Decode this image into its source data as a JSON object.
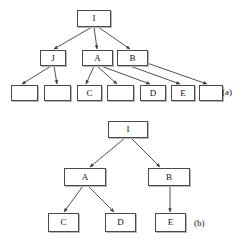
{
  "figure": {
    "panels": [
      {
        "id": "a",
        "label": "(a)",
        "label_x": 222,
        "label_y": 88,
        "nodes": [
          {
            "name": "root-i",
            "text": "I",
            "x": 77,
            "y": 10,
            "w": 34,
            "h": 17
          },
          {
            "name": "node-j",
            "text": "J",
            "x": 40,
            "y": 50,
            "w": 26,
            "h": 16
          },
          {
            "name": "node-a",
            "text": "A",
            "x": 82,
            "y": 50,
            "w": 31,
            "h": 16
          },
          {
            "name": "node-b",
            "text": "B",
            "x": 117,
            "y": 50,
            "w": 31,
            "h": 16
          },
          {
            "name": "leaf-blank-1",
            "text": "",
            "x": 11,
            "y": 85,
            "w": 27,
            "h": 16
          },
          {
            "name": "leaf-blank-2",
            "text": "",
            "x": 44,
            "y": 85,
            "w": 27,
            "h": 16
          },
          {
            "name": "leaf-c",
            "text": "C",
            "x": 77,
            "y": 85,
            "w": 25,
            "h": 16
          },
          {
            "name": "leaf-blank-3",
            "text": "",
            "x": 107,
            "y": 85,
            "w": 27,
            "h": 16
          },
          {
            "name": "leaf-d",
            "text": "D",
            "x": 140,
            "y": 85,
            "w": 26,
            "h": 16
          },
          {
            "name": "leaf-e",
            "text": "E",
            "x": 171,
            "y": 85,
            "w": 24,
            "h": 16
          },
          {
            "name": "leaf-blank-4",
            "text": "",
            "x": 199,
            "y": 85,
            "w": 24,
            "h": 16
          }
        ],
        "edges": [
          {
            "name": "edge-i-j",
            "x1": 92,
            "y1": 27,
            "x2": 54,
            "y2": 49
          },
          {
            "name": "edge-i-a",
            "x1": 94,
            "y1": 27,
            "x2": 97,
            "y2": 49
          },
          {
            "name": "edge-i-b",
            "x1": 98,
            "y1": 27,
            "x2": 130,
            "y2": 49
          },
          {
            "name": "edge-j-l1",
            "x1": 51,
            "y1": 66,
            "x2": 22,
            "y2": 84
          },
          {
            "name": "edge-j-l2",
            "x1": 54,
            "y1": 66,
            "x2": 57,
            "y2": 84
          },
          {
            "name": "edge-a-c",
            "x1": 94,
            "y1": 66,
            "x2": 86,
            "y2": 84
          },
          {
            "name": "edge-a-l3",
            "x1": 97,
            "y1": 66,
            "x2": 117,
            "y2": 84
          },
          {
            "name": "edge-a-d",
            "x1": 101,
            "y1": 66,
            "x2": 150,
            "y2": 84
          },
          {
            "name": "edge-b-e",
            "x1": 130,
            "y1": 66,
            "x2": 180,
            "y2": 84
          },
          {
            "name": "edge-b-l4",
            "x1": 147,
            "y1": 63,
            "x2": 207,
            "y2": 84
          }
        ]
      },
      {
        "id": "b",
        "label": "(b)",
        "label_x": 194,
        "label_y": 219,
        "nodes": [
          {
            "name": "root-i",
            "text": "I",
            "x": 108,
            "y": 121,
            "w": 40,
            "h": 17
          },
          {
            "name": "node-a",
            "text": "A",
            "x": 64,
            "y": 168,
            "w": 42,
            "h": 18
          },
          {
            "name": "node-b",
            "text": "B",
            "x": 148,
            "y": 168,
            "w": 42,
            "h": 18
          },
          {
            "name": "leaf-c",
            "text": "C",
            "x": 48,
            "y": 213,
            "w": 31,
            "h": 19
          },
          {
            "name": "leaf-d",
            "text": "D",
            "x": 105,
            "y": 213,
            "w": 31,
            "h": 19
          },
          {
            "name": "leaf-e",
            "text": "E",
            "x": 155,
            "y": 213,
            "w": 31,
            "h": 19
          }
        ],
        "edges": [
          {
            "name": "edge-i-a",
            "x1": 125,
            "y1": 138,
            "x2": 90,
            "y2": 167
          },
          {
            "name": "edge-i-b",
            "x1": 131,
            "y1": 138,
            "x2": 160,
            "y2": 167
          },
          {
            "name": "edge-a-c",
            "x1": 83,
            "y1": 186,
            "x2": 64,
            "y2": 212
          },
          {
            "name": "edge-a-d",
            "x1": 88,
            "y1": 186,
            "x2": 114,
            "y2": 212
          },
          {
            "name": "edge-b-e",
            "x1": 170,
            "y1": 186,
            "x2": 170,
            "y2": 212
          }
        ]
      }
    ]
  },
  "style": {
    "line_color": "#3d3d3d",
    "box_border": "#4a4a4a",
    "box_fill": "#ffffff",
    "text_color": "#111111",
    "shadow_color": "#b8b8b8"
  },
  "bottom_edge_text": ""
}
